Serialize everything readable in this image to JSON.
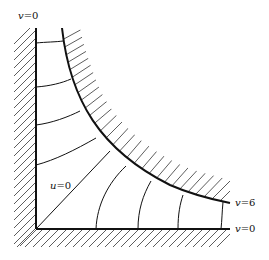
{
  "diagram": {
    "labels": {
      "top_wall": {
        "var": "v",
        "eq": "=0"
      },
      "diagonal": {
        "var": "u",
        "eq": "=0"
      },
      "hyperbola": {
        "var": "v",
        "eq": "=6"
      },
      "bottom_wall": {
        "var": "v",
        "eq": "=0"
      }
    },
    "colors": {
      "line": "#111111",
      "background": "#ffffff"
    }
  }
}
